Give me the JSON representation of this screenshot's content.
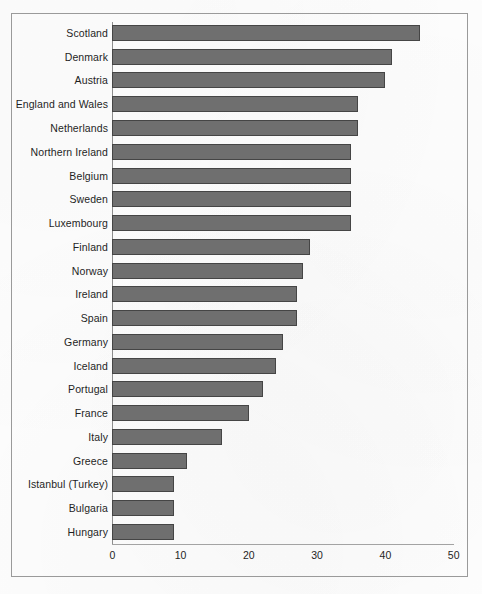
{
  "chart_data": {
    "type": "bar",
    "orientation": "horizontal",
    "title": "",
    "subtitle": "",
    "xlabel": "",
    "ylabel": "",
    "xlim": [
      0,
      50
    ],
    "grid": false,
    "legend": null,
    "categories": [
      "Scotland",
      "Denmark",
      "Austria",
      "England and Wales",
      "Netherlands",
      "Northern Ireland",
      "Belgium",
      "Sweden",
      "Luxembourg",
      "Finland",
      "Norway",
      "Ireland",
      "Spain",
      "Germany",
      "Iceland",
      "Portugal",
      "France",
      "Italy",
      "Greece",
      "Istanbul (Turkey)",
      "Bulgaria",
      "Hungary"
    ],
    "values": [
      45,
      41,
      40,
      36,
      36,
      35,
      35,
      35,
      35,
      29,
      28,
      27,
      27,
      25,
      24,
      22,
      20,
      16,
      11,
      9,
      9,
      9
    ],
    "x_ticks": [
      0,
      10,
      20,
      30,
      40,
      50
    ],
    "x_tick_labels": [
      "0",
      "10",
      "20",
      "30",
      "40",
      "50"
    ],
    "colors": {
      "bar_fill": "#6f6f6f",
      "bar_border": "#454545",
      "axis": "#a3a3a3",
      "frame": "#9a9a9a",
      "text": "#1f1f1f",
      "background": "#fefefe"
    }
  }
}
